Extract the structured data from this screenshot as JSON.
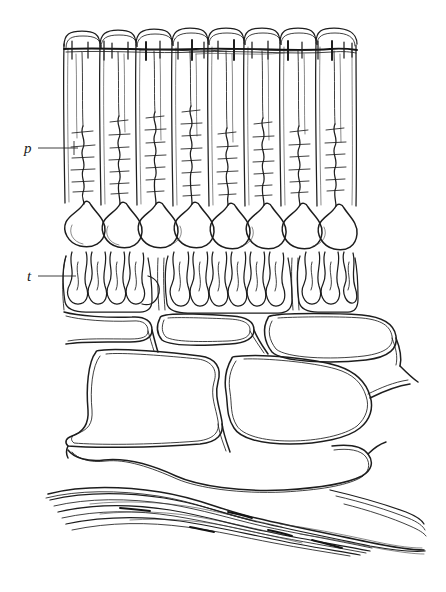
{
  "figure": {
    "kind": "histological-line-drawing",
    "title": "",
    "caption": "",
    "background_color": "#ffffff",
    "ink_color": "#1d1d1d",
    "width": 446,
    "height": 592
  },
  "labels": [
    {
      "id": "p",
      "text": "p",
      "meaning": "palisade-columnar-cell-layer",
      "x": 24,
      "y": 153,
      "leader": {
        "x1": 38,
        "y1": 148,
        "x2": 78,
        "y2": 148
      }
    },
    {
      "id": "t",
      "text": "t",
      "meaning": "tubule-loop-layer",
      "x": 27,
      "y": 281,
      "leader": {
        "x1": 38,
        "y1": 276,
        "x2": 76,
        "y2": 276
      }
    }
  ],
  "layers": [
    {
      "name": "cuticular-border",
      "description": "dark horizontal border line with short vertical tick marks across cell apices",
      "y": 48,
      "x_start": 64,
      "x_end": 357
    },
    {
      "name": "columnar-cell-layer",
      "description": "eight tall columnar cells with rounded apices and internal branched fibers",
      "column_count": 8,
      "x_start": 64,
      "x_end": 357,
      "y_top": 32,
      "y_bottom": 208
    },
    {
      "name": "pear-shaped-cell-bodies",
      "description": "eight flask/pear shaped cell bodies at base of columns",
      "count": 8,
      "y_top": 200,
      "y_bottom": 250
    },
    {
      "name": "tubule-loop-layer",
      "description": "clustered convoluted U-shaped looping tubules in three groups",
      "group_count": 3,
      "y_top": 252,
      "y_bottom": 312
    },
    {
      "name": "polygonal-cell-layer",
      "description": "large irregular polygonal cells drawn with double outlines",
      "cell_count": 7,
      "y_top": 312,
      "y_bottom": 500
    },
    {
      "name": "fibrous-layer",
      "description": "wavy horizontal fibre strands at base of figure",
      "strand_count": 12,
      "y_top": 478,
      "y_bottom": 560
    }
  ],
  "columns": {
    "count": 8,
    "x_centers": [
      82,
      118,
      154,
      190,
      226,
      262,
      298,
      334
    ],
    "boundaries": [
      64,
      100,
      136,
      172,
      208,
      244,
      280,
      316,
      357
    ]
  },
  "tubule_groups": [
    {
      "x_start": 66,
      "x_end": 146,
      "loops": 7
    },
    {
      "x_start": 168,
      "x_end": 288,
      "loops": 10
    },
    {
      "x_start": 300,
      "x_end": 356,
      "loops": 5
    }
  ],
  "fibre_strands": {
    "count": 12,
    "x_start": 48,
    "x_end": 425
  }
}
